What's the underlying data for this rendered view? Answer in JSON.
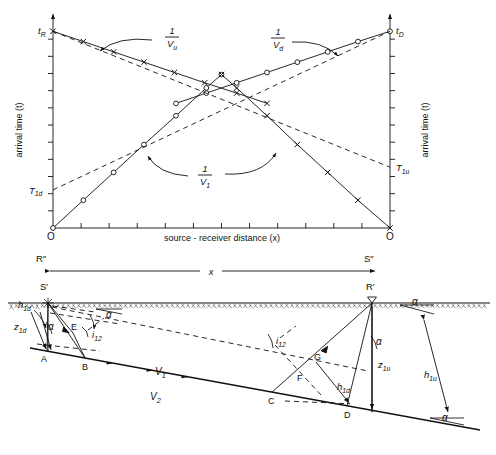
{
  "figure": {
    "name": "seismic-refraction-reciprocal-time-diagram",
    "stroke_color": "#111111",
    "background_color": "#ffffff"
  },
  "traveltime_plot": {
    "y_axis_label_left": "arrival time (t)",
    "y_axis_label_right": "arrival time (t)",
    "x_axis_label": "source - receiver distance (x)",
    "origin_label_left": "O",
    "origin_label_right": "O",
    "intercept_labels": {
      "t_R": "t",
      "t_R_sub": "R",
      "t_D": "t",
      "t_D_sub": "D",
      "T_1d": "T",
      "T_1d_sub": "1d",
      "T_1u": "T",
      "T_1u_sub": "1u"
    },
    "slope_annotations": [
      {
        "name": "inverse-Vu",
        "numerator": "1",
        "denominator": "V",
        "denominator_sub": "u"
      },
      {
        "name": "inverse-Vd",
        "numerator": "1",
        "denominator": "V",
        "denominator_sub": "d"
      },
      {
        "name": "inverse-V1",
        "numerator": "1",
        "denominator": "V",
        "denominator_sub": "1"
      }
    ],
    "x_axis_tick_count": 11,
    "y_axis_tick_count_left": 11,
    "y_axis_tick_count_right": 11
  },
  "chart_data": {
    "type": "line",
    "title": "",
    "xlabel": "source - receiver distance (x)",
    "ylabel": "arrival time (t)",
    "xlim": [
      0,
      1
    ],
    "ylim": [
      0,
      1
    ],
    "grid": false,
    "legend": "none",
    "series": [
      {
        "name": "refracted-downdip-from-R",
        "marker": "x",
        "line": "solid",
        "annotation": "1/Vu",
        "intercept_label": "tR",
        "x": [
          0.0,
          0.09,
          0.18,
          0.27,
          0.36,
          0.45,
          0.545,
          0.635
        ],
        "y": [
          0.955,
          0.905,
          0.855,
          0.805,
          0.755,
          0.705,
          0.655,
          0.605
        ]
      },
      {
        "name": "refracted-updip-from-D",
        "marker": "o",
        "line": "solid",
        "annotation": "1/Vd",
        "intercept_label": "tD",
        "x": [
          0.365,
          0.455,
          0.545,
          0.635,
          0.725,
          0.815,
          0.905,
          1.0
        ],
        "y": [
          0.605,
          0.655,
          0.705,
          0.755,
          0.805,
          0.855,
          0.905,
          0.955
        ]
      },
      {
        "name": "direct-wave-from-left-origin",
        "marker": "o",
        "line": "solid",
        "annotation": "1/V1",
        "x": [
          0.0,
          0.09,
          0.18,
          0.27,
          0.365,
          0.455,
          0.5
        ],
        "y": [
          0.0,
          0.135,
          0.27,
          0.405,
          0.545,
          0.68,
          0.745
        ]
      },
      {
        "name": "direct-wave-from-right-origin",
        "marker": "x",
        "line": "solid",
        "annotation": "1/V1",
        "x": [
          0.5,
          0.545,
          0.635,
          0.725,
          0.815,
          0.905,
          1.0
        ],
        "y": [
          0.745,
          0.68,
          0.545,
          0.405,
          0.27,
          0.135,
          0.0
        ]
      },
      {
        "name": "dashed-extension-downdip",
        "marker": "none",
        "line": "dashed",
        "intercept_label": "T1u",
        "x": [
          0.0,
          1.0
        ],
        "y": [
          0.955,
          0.295
        ]
      },
      {
        "name": "dashed-extension-updip",
        "marker": "none",
        "line": "dashed",
        "intercept_label": "T1d",
        "x": [
          0.0,
          1.0
        ],
        "y": [
          0.185,
          0.955
        ]
      }
    ]
  },
  "ray_diagram": {
    "surface_points": {
      "R_double_prime": "R″",
      "S_double_prime": "S″",
      "S_prime": "S′",
      "R_prime": "R′"
    },
    "offset_arrow_label": "x",
    "interface_points": [
      "A",
      "B",
      "C",
      "D",
      "E",
      "F",
      "G"
    ],
    "velocity_labels": [
      {
        "name": "layer-1-velocity",
        "base": "V",
        "sub": "1"
      },
      {
        "name": "layer-2-velocity",
        "base": "V",
        "sub": "2"
      }
    ],
    "angle_labels": [
      {
        "name": "dip-angle-surface-left",
        "text": "α"
      },
      {
        "name": "dip-angle-source-left",
        "text": "α"
      },
      {
        "name": "dip-angle-receiver-right",
        "text": "α"
      },
      {
        "name": "dip-angle-surface-right",
        "text": "α"
      },
      {
        "name": "dip-angle-bottom-right",
        "text": "α"
      }
    ],
    "critical_angle_labels": [
      {
        "name": "critical-angle-left",
        "base": "i",
        "sub": "12"
      },
      {
        "name": "critical-angle-right",
        "base": "i",
        "sub": "12"
      }
    ],
    "depth_labels": [
      {
        "name": "perpendicular-depth-downdip-left",
        "base": "h",
        "sub": "1d"
      },
      {
        "name": "vertical-depth-downdip-left",
        "base": "z",
        "sub": "1d"
      },
      {
        "name": "vertical-depth-updip-right",
        "base": "z",
        "sub": "1u"
      },
      {
        "name": "perpendicular-depth-downdip-right",
        "base": "h",
        "sub": "1d"
      },
      {
        "name": "perpendicular-depth-updip-right",
        "base": "h",
        "sub": "1u"
      }
    ]
  }
}
